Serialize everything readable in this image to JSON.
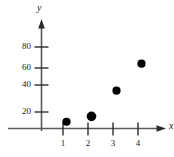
{
  "chart_data": {
    "type": "scatter",
    "title": "",
    "xlabel": "x",
    "ylabel": "y",
    "x": [
      1,
      2,
      3,
      4
    ],
    "values": [
      5,
      9,
      28,
      48
    ],
    "points": [
      {
        "x": 1,
        "y": 5
      },
      {
        "x": 2,
        "y": 9
      },
      {
        "x": 3,
        "y": 28
      },
      {
        "x": 4,
        "y": 48
      }
    ],
    "xticks": [
      "1",
      "2",
      "3",
      "4"
    ],
    "yticks": [
      "20",
      "40",
      "60",
      "80"
    ],
    "xlim": [
      0,
      4.9
    ],
    "ylim": [
      0,
      95
    ],
    "grid": false,
    "legend": null,
    "marker_color": "#000000",
    "axis_color": "#595959"
  },
  "axes": {
    "y_axis_name": "y",
    "x_axis_name": "x"
  },
  "ticks": {
    "y": [
      {
        "label": "20",
        "value": 20
      },
      {
        "label": "40",
        "value": 40
      },
      {
        "label": "60",
        "value": 60
      },
      {
        "label": "80",
        "value": 80
      }
    ],
    "x": [
      {
        "label": "1",
        "value": 1
      },
      {
        "label": "2",
        "value": 2
      },
      {
        "label": "3",
        "value": 3
      },
      {
        "label": "4",
        "value": 4
      }
    ]
  }
}
